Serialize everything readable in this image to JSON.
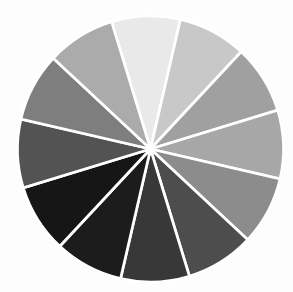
{
  "page": {
    "background_color": "#fdfdfd"
  },
  "chart_data": {
    "type": "pie",
    "description_name": "grayscale-value-wheel",
    "title": "",
    "legend": "none",
    "labels_shown": false,
    "slices": [
      {
        "index": 1,
        "position": "12-o-clock",
        "value": 1,
        "angle_deg": 30,
        "color": "#e9e9e9"
      },
      {
        "index": 2,
        "position": "1-o-clock",
        "value": 1,
        "angle_deg": 30,
        "color": "#c8c8c8"
      },
      {
        "index": 3,
        "position": "2-o-clock",
        "value": 1,
        "angle_deg": 30,
        "color": "#a0a0a0"
      },
      {
        "index": 4,
        "position": "3-o-clock",
        "value": 1,
        "angle_deg": 30,
        "color": "#a7a7a7"
      },
      {
        "index": 5,
        "position": "4-o-clock",
        "value": 1,
        "angle_deg": 30,
        "color": "#8c8c8c"
      },
      {
        "index": 6,
        "position": "5-o-clock",
        "value": 1,
        "angle_deg": 30,
        "color": "#4e4e4e"
      },
      {
        "index": 7,
        "position": "6-o-clock",
        "value": 1,
        "angle_deg": 30,
        "color": "#373737"
      },
      {
        "index": 8,
        "position": "7-o-clock",
        "value": 1,
        "angle_deg": 30,
        "color": "#1e1e1e"
      },
      {
        "index": 9,
        "position": "8-o-clock",
        "value": 1,
        "angle_deg": 30,
        "color": "#141414"
      },
      {
        "index": 10,
        "position": "9-o-clock",
        "value": 1,
        "angle_deg": 30,
        "color": "#535353"
      },
      {
        "index": 11,
        "position": "10-o-clock",
        "value": 1,
        "angle_deg": 30,
        "color": "#7e7e7e"
      },
      {
        "index": 12,
        "position": "11-o-clock",
        "value": 1,
        "angle_deg": 30,
        "color": "#ababab"
      }
    ],
    "layout": {
      "center_x": 150.5,
      "center_y": 149,
      "radius": 133,
      "start_angle_deg_from_north": -17,
      "direction": "clockwise",
      "divider_color": "#ffffff",
      "divider_width": 2.7,
      "center_hub_color": "#ffffff",
      "center_hub_radius": 3.5
    }
  }
}
